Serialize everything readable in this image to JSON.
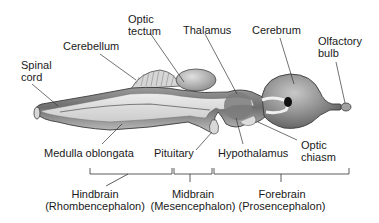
{
  "diagram": {
    "labels": {
      "spinal_cord": [
        "Spinal",
        "cord"
      ],
      "cerebellum": "Cerebellum",
      "optic_tectum": [
        "Optic",
        "tectum"
      ],
      "thalamus": "Thalamus",
      "cerebrum": "Cerebrum",
      "olfactory_bulb": [
        "Olfactory",
        "bulb"
      ],
      "medulla_oblongata": "Medulla oblongata",
      "pituitary": "Pituitary",
      "hypothalamus": "Hypothalamus",
      "optic_chiasm": [
        "Optic",
        "chiasm"
      ]
    },
    "divisions": [
      {
        "name": "Hindbrain",
        "latin": "(Rhombencephalon)"
      },
      {
        "name": "Midbrain",
        "latin": "(Mesencephalon)"
      },
      {
        "name": "Forebrain",
        "latin": "(Prosencephalon)"
      }
    ],
    "colors": {
      "tissue_dark": "#7a7a7a",
      "tissue_mid": "#a8a8a8",
      "tissue_light": "#e4e4e4",
      "outline": "#3a3a3a",
      "leader": "#333333"
    }
  }
}
